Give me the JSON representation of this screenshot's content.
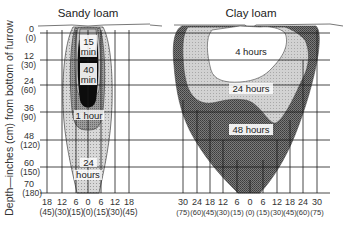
{
  "figure": {
    "y_axis_label": "Depth—inches (cm) from bottom of furrow",
    "y_ticks": [
      {
        "in": "0",
        "cm": "(0)"
      },
      {
        "in": "12",
        "cm": "(30)"
      },
      {
        "in": "24",
        "cm": "(60)"
      },
      {
        "in": "36",
        "cm": "(90)"
      },
      {
        "in": "48",
        "cm": "(120)"
      },
      {
        "in": "60",
        "cm": "(150)"
      },
      {
        "in": "70",
        "cm": "(180)"
      }
    ],
    "panels": [
      {
        "title": "Sandy loam",
        "x_ticks": [
          {
            "in": "18",
            "cm": "(45)"
          },
          {
            "in": "12",
            "cm": "(30)"
          },
          {
            "in": "6",
            "cm": "(15)"
          },
          {
            "in": "0",
            "cm": "(0)"
          },
          {
            "in": "6",
            "cm": "(15)"
          },
          {
            "in": "12",
            "cm": "(30)"
          },
          {
            "in": "18",
            "cm": "(45)"
          }
        ],
        "zones": [
          {
            "label_line1": "15",
            "label_line2": "min",
            "shade": "#bdbdbd"
          },
          {
            "label_line1": "40",
            "label_line2": "min",
            "shade": "#0a0a0a"
          },
          {
            "label_line1": "1 hour",
            "label_line2": "",
            "shade": "#8c8c8c"
          },
          {
            "label_line1": "24",
            "label_line2": "hours",
            "shade": "#d4d4d4"
          }
        ]
      },
      {
        "title": "Clay loam",
        "x_ticks": [
          {
            "in": "30",
            "cm": "(75)"
          },
          {
            "in": "24",
            "cm": "(60)"
          },
          {
            "in": "18",
            "cm": "(45)"
          },
          {
            "in": "12",
            "cm": "(30)"
          },
          {
            "in": "6",
            "cm": "(15)"
          },
          {
            "in": "0",
            "cm": "(0)"
          },
          {
            "in": "6",
            "cm": "(15)"
          },
          {
            "in": "12",
            "cm": "(30)"
          },
          {
            "in": "18",
            "cm": "(45)"
          },
          {
            "in": "24",
            "cm": "(60)"
          },
          {
            "in": "30",
            "cm": "(75)"
          }
        ],
        "zones": [
          {
            "label": "4 hours",
            "shade": "#ffffff"
          },
          {
            "label": "24 hours",
            "shade": "#cfcfcf"
          },
          {
            "label": "48 hours",
            "shade": "#6e6e6e"
          }
        ]
      }
    ]
  }
}
